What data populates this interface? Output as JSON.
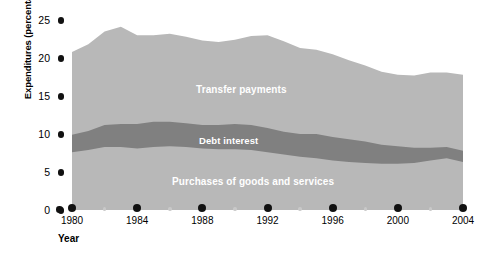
{
  "chart_data": {
    "type": "area",
    "title": "",
    "xlabel": "Year",
    "ylabel": "Expenditures (percentage of GDP)",
    "xlim": [
      1980,
      2004
    ],
    "ylim": [
      0,
      25
    ],
    "yticks": [
      25,
      20,
      15,
      10,
      5,
      0
    ],
    "xticks": [
      1980,
      1984,
      1988,
      1992,
      1996,
      2000,
      2004
    ],
    "xticks_minor": [
      1982,
      1986,
      1990,
      1994,
      1998,
      2002
    ],
    "grid": false,
    "legend": "inline-labels",
    "stacked": true,
    "x": [
      1980,
      1981,
      1982,
      1983,
      1984,
      1985,
      1986,
      1987,
      1988,
      1989,
      1990,
      1991,
      1992,
      1993,
      1994,
      1995,
      1996,
      1997,
      1998,
      1999,
      2000,
      2001,
      2002,
      2003,
      2004
    ],
    "series": [
      {
        "name": "Purchases of goods and services",
        "color": "#b8b8b8",
        "values": [
          7.6,
          7.9,
          8.3,
          8.3,
          8.1,
          8.3,
          8.4,
          8.3,
          8.1,
          8.0,
          8.0,
          7.9,
          7.6,
          7.3,
          7.0,
          6.8,
          6.5,
          6.3,
          6.2,
          6.1,
          6.1,
          6.2,
          6.5,
          6.8,
          6.3
        ]
      },
      {
        "name": "Debt interest",
        "color": "#808080",
        "values": [
          2.3,
          2.5,
          2.9,
          3.0,
          3.2,
          3.3,
          3.2,
          3.1,
          3.1,
          3.2,
          3.3,
          3.3,
          3.2,
          3.0,
          3.0,
          3.2,
          3.1,
          3.0,
          2.8,
          2.5,
          2.3,
          2.0,
          1.7,
          1.5,
          1.5
        ]
      },
      {
        "name": "Transfer payments",
        "color": "#b8b8b8",
        "values": [
          10.9,
          11.4,
          12.3,
          12.8,
          11.7,
          11.4,
          11.6,
          11.4,
          11.1,
          10.9,
          11.1,
          11.7,
          12.2,
          11.9,
          11.3,
          11.1,
          10.9,
          10.4,
          10.0,
          9.6,
          9.4,
          9.5,
          9.9,
          9.8,
          10.0
        ]
      }
    ],
    "stack_tops": {
      "purchases": [
        7.6,
        7.9,
        8.3,
        8.3,
        8.1,
        8.3,
        8.4,
        8.3,
        8.1,
        8.0,
        8.0,
        7.9,
        7.6,
        7.3,
        7.0,
        6.8,
        6.5,
        6.3,
        6.2,
        6.1,
        6.1,
        6.2,
        6.5,
        6.8,
        6.3
      ],
      "debt": [
        9.9,
        10.4,
        11.2,
        11.3,
        11.3,
        11.6,
        11.6,
        11.4,
        11.2,
        11.2,
        11.3,
        11.2,
        10.8,
        10.3,
        10.0,
        10.0,
        9.6,
        9.3,
        9.0,
        8.6,
        8.4,
        8.2,
        8.2,
        8.3,
        7.8
      ],
      "total": [
        20.8,
        21.8,
        23.5,
        24.1,
        23.0,
        23.0,
        23.2,
        22.8,
        22.3,
        22.1,
        22.4,
        22.9,
        23.0,
        22.2,
        21.3,
        21.1,
        20.5,
        19.7,
        19.0,
        18.2,
        17.8,
        17.7,
        18.1,
        18.1,
        17.8
      ]
    }
  },
  "axis": {
    "y_title": "Expenditures (percentage of GDP)",
    "x_title": "Year",
    "y_labels": [
      "25",
      "20",
      "15",
      "10",
      "5",
      "0"
    ],
    "x_labels": [
      "1980",
      "1984",
      "1988",
      "1992",
      "1996",
      "2000",
      "2004"
    ]
  },
  "band_labels": {
    "transfer": "Transfer payments",
    "debt": "Debt interest",
    "purchases": "Purchases of goods and services"
  },
  "colors": {
    "light_band": "#b8b8b8",
    "dark_band": "#808080",
    "tick_dot": "#111111",
    "minor_dot": "#c9c9c9",
    "label_text": "#ffffff",
    "background": "#ffffff"
  }
}
